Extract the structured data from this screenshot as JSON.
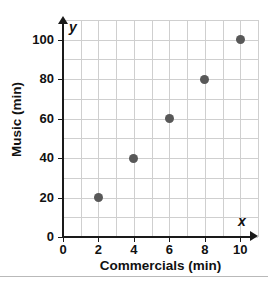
{
  "chart_data": {
    "type": "scatter",
    "title": "",
    "xlabel": "Commercials (min)",
    "ylabel": "Music (min)",
    "x_symbol": "x",
    "y_symbol": "y",
    "xlim": [
      0,
      11
    ],
    "ylim": [
      0,
      110
    ],
    "x_ticks": [
      0,
      2,
      4,
      6,
      8,
      10
    ],
    "y_ticks": [
      0,
      20,
      40,
      60,
      80,
      100
    ],
    "x_ticklabels": [
      "0",
      "2",
      "4",
      "6",
      "8",
      "10"
    ],
    "y_ticklabels": [
      "0",
      "20",
      "40",
      "60",
      "80",
      "100"
    ],
    "x_minor_step": 1,
    "y_minor_step": 10,
    "grid": true,
    "grid_color": "#cfcfcf",
    "legend": "none",
    "marker_color": "#585858",
    "axis_color": "#1a1a1a",
    "background": "#ffffff",
    "points": [
      {
        "x": 2,
        "y": 20
      },
      {
        "x": 4,
        "y": 40
      },
      {
        "x": 6,
        "y": 60
      },
      {
        "x": 8,
        "y": 80
      },
      {
        "x": 10,
        "y": 100
      }
    ]
  }
}
